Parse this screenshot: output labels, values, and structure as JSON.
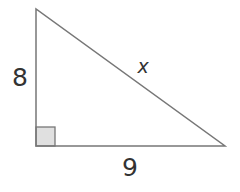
{
  "diagram": {
    "type": "right-triangle",
    "vertices": {
      "top": [
        36,
        9
      ],
      "right_angle": [
        36,
        146
      ],
      "right": [
        225,
        146
      ]
    },
    "right_angle_box": {
      "x": 36,
      "y": 127,
      "size": 19,
      "fill": "#e0e0e0"
    },
    "stroke_color": "#777777",
    "labels": {
      "vertical_leg": "8",
      "horizontal_leg": "9",
      "hypotenuse": "x"
    }
  }
}
